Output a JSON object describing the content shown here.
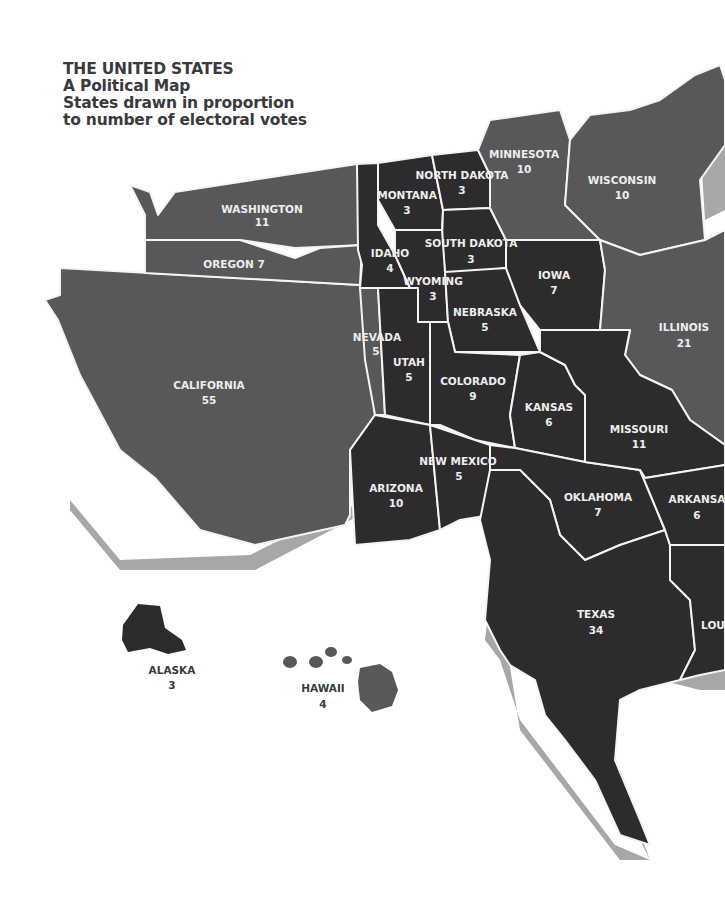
{
  "title": {
    "line1": "THE UNITED STATES",
    "line2": "A Political Map",
    "line3": "States drawn in proportion",
    "line4": "to number of electoral votes"
  },
  "colors": {
    "dark_state": "#2e2b2e",
    "medium_state": "#58585a",
    "border": "#f4f4f4",
    "shadow": "#a7a7a7",
    "title_text": "#3a3a3c"
  },
  "states": {
    "washington": {
      "name": "WASHINGTON",
      "votes": "11"
    },
    "oregon": {
      "name": "OREGON 7",
      "votes": ""
    },
    "california": {
      "name": "CALIFORNIA",
      "votes": "55"
    },
    "nevada": {
      "name": "NEVADA",
      "votes": "5"
    },
    "idaho": {
      "name": "IDAHO",
      "votes": "4"
    },
    "montana": {
      "name": "MONTANA",
      "votes": "3"
    },
    "wyoming": {
      "name": "WYOMING",
      "votes": "3"
    },
    "utah": {
      "name": "UTAH",
      "votes": "5"
    },
    "arizona": {
      "name": "ARIZONA",
      "votes": "10"
    },
    "colorado": {
      "name": "COLORADO",
      "votes": "9"
    },
    "new_mexico": {
      "name": "NEW MEXICO",
      "votes": "5"
    },
    "north_dakota": {
      "name": "NORTH DAKOTA",
      "votes": "3"
    },
    "south_dakota": {
      "name": "SOUTH DAKOTA",
      "votes": "3"
    },
    "nebraska": {
      "name": "NEBRASKA",
      "votes": "5"
    },
    "kansas": {
      "name": "KANSAS",
      "votes": "6"
    },
    "oklahoma": {
      "name": "OKLAHOMA",
      "votes": "7"
    },
    "texas": {
      "name": "TEXAS",
      "votes": "34"
    },
    "minnesota": {
      "name": "MINNESOTA",
      "votes": "10"
    },
    "iowa": {
      "name": "IOWA",
      "votes": "7"
    },
    "missouri": {
      "name": "MISSOURI",
      "votes": "11"
    },
    "arkansas": {
      "name": "ARKANSA",
      "votes": "6"
    },
    "louisiana": {
      "name": "LOU",
      "votes": ""
    },
    "wisconsin": {
      "name": "WISCONSIN",
      "votes": "10"
    },
    "illinois": {
      "name": "ILLINOIS",
      "votes": "21"
    },
    "alaska": {
      "name": "ALASKA",
      "votes": "3"
    },
    "hawaii": {
      "name": "HAWAII",
      "votes": "4"
    }
  }
}
